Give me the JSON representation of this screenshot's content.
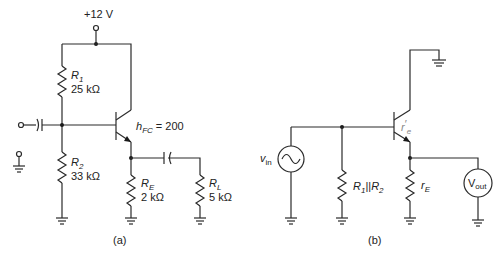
{
  "figure": {
    "panel_a": {
      "caption": "(a)",
      "supply_label": "+12 V",
      "r1": {
        "name": "R",
        "sub": "1",
        "value": "25 kΩ"
      },
      "r2": {
        "name": "R",
        "sub": "2",
        "value": "33 kΩ"
      },
      "re": {
        "name": "R",
        "sub": "E",
        "value": "2 kΩ"
      },
      "rl": {
        "name": "R",
        "sub": "L",
        "value": "5 kΩ"
      },
      "gain": {
        "name": "h",
        "sub": "FC",
        "value": " = 200"
      }
    },
    "panel_b": {
      "caption": "(b)",
      "source": {
        "name": "v",
        "sub": "in"
      },
      "rpar": {
        "label1": "R",
        "sub1": "1",
        "sep": "||",
        "label2": "R",
        "sub2": "2"
      },
      "re_prime": {
        "name": "r",
        "prime": "′",
        "sub": "e"
      },
      "re_small": {
        "name": "r",
        "sub": "E"
      },
      "meter": {
        "name": "V",
        "sub": "out"
      }
    },
    "colors": {
      "wire": "#2a2a2a",
      "meter_fill": "#e6e6e6",
      "annotation_gray": "#888888"
    }
  }
}
